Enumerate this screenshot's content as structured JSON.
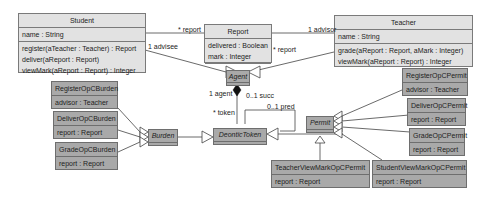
{
  "classes": {
    "student": {
      "name": "Student",
      "attributes": [
        "name : String"
      ],
      "operations": [
        "register(aTeacher : Teacher) : Report",
        "deliver(aReport : Report)",
        "viewMark(aReport : Report) : Integer"
      ]
    },
    "report": {
      "name": "Report",
      "attributes": [
        "delivered : Boolean",
        "mark : Integer"
      ]
    },
    "teacher": {
      "name": "Teacher",
      "attributes": [
        "name : String"
      ],
      "operations": [
        "grade(aReport : Report, aMark : Integer)",
        "viewMark(aReport : Report) : Integer"
      ]
    },
    "agent": {
      "name": "Agent",
      "abstract": true
    },
    "deontic_token": {
      "name": "DeonticToken",
      "abstract": true
    },
    "burden": {
      "name": "Burden",
      "abstract": true
    },
    "permit": {
      "name": "Permit",
      "abstract": true
    },
    "register_burden": {
      "name": "RegisterOpCBurden",
      "attributes": [
        "advisor : Teacher"
      ]
    },
    "deliver_burden": {
      "name": "DeliverOpCBurden",
      "attributes": [
        "report : Report"
      ]
    },
    "grade_burden": {
      "name": "GradeOpCBurden",
      "attributes": [
        "report : Report"
      ]
    },
    "register_permit": {
      "name": "RegisterOpCPermit",
      "attributes": [
        "advisor : Teacher"
      ]
    },
    "deliver_permit": {
      "name": "DeliverOpCPermit",
      "attributes": [
        "report : Report"
      ]
    },
    "grade_permit": {
      "name": "GradeOpCPermit",
      "attributes": [
        "report : Report"
      ]
    },
    "teacher_view_permit": {
      "name": "TeacherViewMarkOpCPermit",
      "attributes": [
        "report : Report"
      ]
    },
    "student_view_permit": {
      "name": "StudentViewMarkOpCPermit",
      "attributes": [
        "report : Report"
      ]
    }
  },
  "labels": {
    "student_report": "* report",
    "student_advisee": "1 advisee",
    "teacher_advisor": "1 advisor",
    "teacher_report": "* report",
    "agent_role": "1 agent",
    "token_role": "* token",
    "succ_role": "0..1 succ",
    "pred_role": "0..1 pred"
  },
  "colors": {
    "light_fill": "#e2e2e2",
    "dark_fill": "#a9a9a9",
    "border": "#7a7a7a",
    "line": "#444444"
  }
}
